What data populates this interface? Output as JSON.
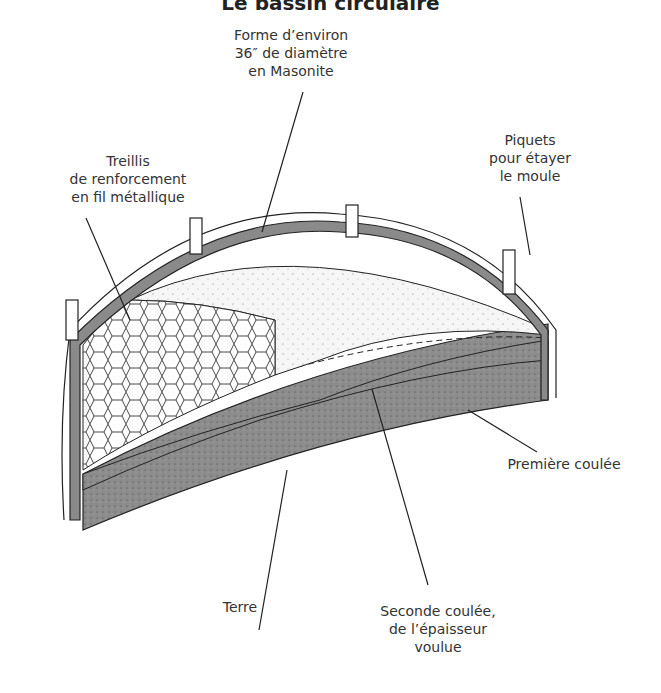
{
  "title": "Le bassin circulaire",
  "labels": {
    "forme": [
      "Forme d’environ",
      "36″ de diamètre",
      "en Masonite"
    ],
    "treillis": [
      "Treillis",
      "de renforcement",
      "en fil métallique"
    ],
    "piquets": [
      "Piquets",
      "pour étayer",
      "le moule"
    ],
    "premiere": [
      "Première coulée"
    ],
    "terre": [
      "Terre"
    ],
    "seconde": [
      "Seconde coulée,",
      "de l’épaisseur",
      "voulue"
    ]
  },
  "colors": {
    "dark_fill": "#8a8a8a",
    "light_fill": "#f4f4f4",
    "line": "#222222"
  }
}
